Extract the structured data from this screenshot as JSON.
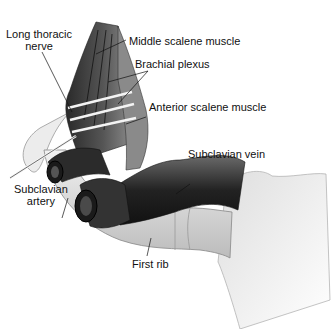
{
  "figure": {
    "labels": {
      "long_thoracic_nerve": [
        "Long thoracic",
        "nerve"
      ],
      "middle_scalene_muscle": "Middle scalene muscle",
      "brachial_plexus": "Brachial plexus",
      "anterior_scalene_muscle": "Anterior scalene muscle",
      "subclavian_vein": "Subclavian vein",
      "subclavian_artery": [
        "Subclavian",
        "artery"
      ],
      "first_rib": "First rib"
    }
  }
}
